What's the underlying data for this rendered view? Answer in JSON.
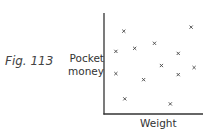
{
  "figure_label": "Fig. 113",
  "chart_data": {
    "type": "scatter",
    "title": "",
    "xlabel": "Weight",
    "ylabel": "Pocket money",
    "ylabel_lines": [
      "Pocket",
      "money"
    ],
    "x_ticks": [],
    "y_ticks": [],
    "grid": false,
    "marker": "x",
    "xlim": [
      0,
      100
    ],
    "ylim": [
      0,
      100
    ],
    "points": [
      {
        "x": 20,
        "y": 82
      },
      {
        "x": 88,
        "y": 86
      },
      {
        "x": 12,
        "y": 62
      },
      {
        "x": 31,
        "y": 65
      },
      {
        "x": 51,
        "y": 70
      },
      {
        "x": 75,
        "y": 60
      },
      {
        "x": 58,
        "y": 48
      },
      {
        "x": 91,
        "y": 46
      },
      {
        "x": 12,
        "y": 40
      },
      {
        "x": 75,
        "y": 39
      },
      {
        "x": 40,
        "y": 34
      },
      {
        "x": 21,
        "y": 15
      },
      {
        "x": 67,
        "y": 10
      }
    ]
  }
}
